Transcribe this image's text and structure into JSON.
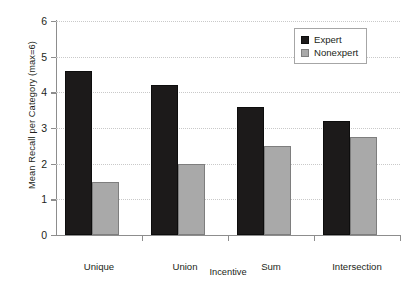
{
  "chart_data": {
    "type": "bar",
    "title": "",
    "xlabel": "Incentive",
    "ylabel": "Mean Recall per Category (max=6)",
    "categories": [
      "Unique",
      "Union",
      "Sum",
      "Intersection"
    ],
    "series": [
      {
        "name": "Expert",
        "color": "#1c1a1a",
        "values": [
          4.6,
          4.2,
          3.6,
          3.2
        ]
      },
      {
        "name": "Nonexpert",
        "color": "#a9a9a9",
        "values": [
          1.5,
          2.0,
          2.5,
          2.75
        ]
      }
    ],
    "ylim": [
      0,
      6
    ],
    "ytick_labels": [
      "0",
      "1",
      "2",
      "3",
      "4",
      "5",
      "6"
    ],
    "ytick_values": [
      0,
      1,
      2,
      3,
      4,
      5,
      6
    ],
    "grid": true,
    "grid_axis": "y",
    "grid_style": "dotted",
    "legend_position": "top-right",
    "legend_entries": [
      "Expert",
      "Nonexpert"
    ]
  }
}
